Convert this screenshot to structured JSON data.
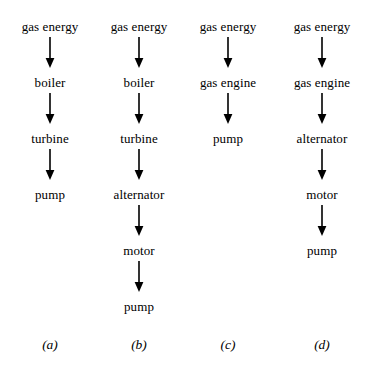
{
  "figure": {
    "background_color": "#ffffff",
    "ink_color": "#000000",
    "width": 386,
    "height": 376,
    "row_pitch": 56,
    "first_label_y": 20,
    "columns": [
      {
        "id": "a",
        "caption": "(a)",
        "center_x": 50,
        "nodes": [
          "gas energy",
          "boiler",
          "turbine",
          "pump"
        ],
        "arrow_icon": "down-arrow-icon"
      },
      {
        "id": "b",
        "caption": "(b)",
        "center_x": 139,
        "nodes": [
          "gas energy",
          "boiler",
          "turbine",
          "alternator",
          "motor",
          "pump"
        ],
        "arrow_icon": "down-arrow-icon"
      },
      {
        "id": "c",
        "caption": "(c)",
        "center_x": 228,
        "nodes": [
          "gas energy",
          "gas engine",
          "pump"
        ],
        "arrow_icon": "down-arrow-icon"
      },
      {
        "id": "d",
        "caption": "(d)",
        "center_x": 322,
        "nodes": [
          "gas energy",
          "gas engine",
          "alternator",
          "motor",
          "pump"
        ],
        "arrow_icon": "down-arrow-icon"
      }
    ],
    "caption_y": 338
  }
}
